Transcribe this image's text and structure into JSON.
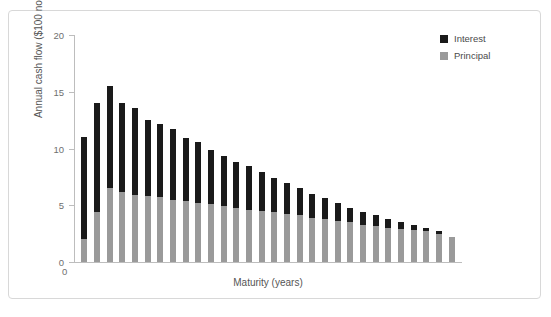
{
  "chart_data": {
    "type": "bar",
    "subtype": "stacked-vertical",
    "title": "",
    "xlabel": "Maturity (years)",
    "ylabel": "Annual cash flow ($100 nominal)",
    "ylim": [
      0,
      20
    ],
    "yticks": [
      0,
      5,
      10,
      15,
      20
    ],
    "ytick_labels": [
      "0",
      "5",
      "10",
      "15",
      "20"
    ],
    "xtick_labels": [
      "0"
    ],
    "grid": false,
    "legend_position": "top-right",
    "categories": [
      1,
      2,
      3,
      4,
      5,
      6,
      7,
      8,
      9,
      10,
      11,
      12,
      13,
      14,
      15,
      16,
      17,
      18,
      19,
      20,
      21,
      22,
      23,
      24,
      25,
      26,
      27,
      28,
      29,
      30
    ],
    "series": [
      {
        "name": "Principal",
        "color": "#9a9a9a",
        "values": [
          2.0,
          4.4,
          6.5,
          6.2,
          5.9,
          5.8,
          5.7,
          5.5,
          5.4,
          5.2,
          5.1,
          4.9,
          4.8,
          4.6,
          4.5,
          4.4,
          4.2,
          4.1,
          3.9,
          3.8,
          3.6,
          3.5,
          3.3,
          3.2,
          3.0,
          2.9,
          2.8,
          2.7,
          2.5,
          2.2
        ]
      },
      {
        "name": "Interest",
        "color": "#1a1a1a",
        "values": [
          9.0,
          9.6,
          9.0,
          7.8,
          7.7,
          6.7,
          6.5,
          6.2,
          5.5,
          5.4,
          4.8,
          4.4,
          4.0,
          3.9,
          3.4,
          3.0,
          2.8,
          2.4,
          2.1,
          1.8,
          1.6,
          1.3,
          1.1,
          0.9,
          0.8,
          0.6,
          0.5,
          0.3,
          0.2,
          0.0
        ]
      }
    ],
    "totals": [
      11.0,
      14.0,
      15.5,
      14.0,
      13.6,
      12.5,
      12.2,
      11.7,
      10.9,
      10.6,
      9.9,
      9.3,
      8.8,
      8.5,
      7.9,
      7.4,
      7.0,
      6.5,
      6.0,
      5.6,
      5.2,
      4.8,
      4.4,
      4.1,
      3.8,
      3.5,
      3.3,
      3.0,
      2.7,
      2.2
    ],
    "legend": [
      {
        "label": "Interest",
        "color": "#1a1a1a"
      },
      {
        "label": "Principal",
        "color": "#9a9a9a"
      }
    ]
  }
}
